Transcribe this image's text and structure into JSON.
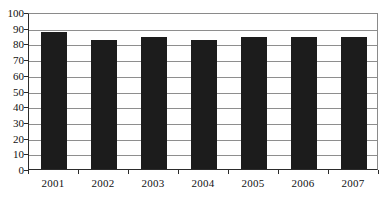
{
  "chart_data": {
    "type": "bar",
    "title": "",
    "subtitle": "",
    "xlabel": "",
    "ylabel": "",
    "categories": [
      "2001",
      "2002",
      "2003",
      "2004",
      "2005",
      "2006",
      "2007"
    ],
    "values": [
      87,
      82,
      84,
      82,
      84,
      84,
      84
    ],
    "series": [
      {
        "name": "",
        "values": [
          87,
          82,
          84,
          82,
          84,
          84,
          84
        ]
      }
    ],
    "ylim": [
      0,
      100
    ],
    "ytick_labels": [
      "0",
      "10",
      "20",
      "30",
      "40",
      "50",
      "60",
      "70",
      "80",
      "90",
      "100"
    ],
    "ytick_values": [
      0,
      10,
      20,
      30,
      40,
      50,
      60,
      70,
      80,
      90,
      100
    ],
    "grid": true,
    "grid_axis": "y",
    "legend": false,
    "legend_position": "none",
    "bar_color": "#1c1c1c",
    "grid_color": "#8e8e8e",
    "axis_color": "#2b2b2b",
    "background_color": "#ffffff"
  }
}
